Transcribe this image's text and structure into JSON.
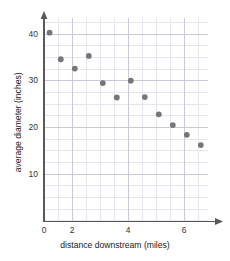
{
  "chart_data": {
    "type": "scatter",
    "title": "",
    "xlabel": "distance downstream (miles)",
    "ylabel": "average diameter (inches)",
    "xlim": [
      0,
      7.5
    ],
    "ylim": [
      0,
      45
    ],
    "x_ticks": [
      0,
      2,
      4,
      6
    ],
    "x_tick_labels": [
      "0",
      "2",
      "4",
      "6"
    ],
    "y_ticks": [
      10,
      20,
      30,
      40
    ],
    "y_tick_labels": [
      "10",
      "20",
      "30",
      "40"
    ],
    "grid": true,
    "grid_minor_step_x": 0.5,
    "grid_minor_step_y": 2.5,
    "legend": "none",
    "marker_color": "#767676",
    "grid_color": "#d9d9e6",
    "axis_color": "#595959",
    "points": [
      {
        "x": 1.2,
        "y": 40.3
      },
      {
        "x": 1.6,
        "y": 34.6
      },
      {
        "x": 2.1,
        "y": 32.6
      },
      {
        "x": 2.6,
        "y": 35.3
      },
      {
        "x": 3.1,
        "y": 29.5
      },
      {
        "x": 3.6,
        "y": 26.4
      },
      {
        "x": 4.1,
        "y": 30.0
      },
      {
        "x": 4.6,
        "y": 26.5
      },
      {
        "x": 5.1,
        "y": 22.8
      },
      {
        "x": 5.6,
        "y": 20.5
      },
      {
        "x": 6.1,
        "y": 18.4
      },
      {
        "x": 6.6,
        "y": 16.2
      }
    ]
  }
}
